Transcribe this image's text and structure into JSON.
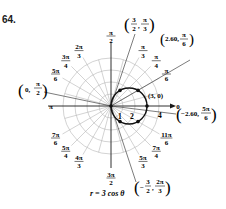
{
  "problem_number": "64.",
  "equation": "r = 3 cos θ",
  "colors": {
    "grid": "#b5b5b5",
    "axis": "#1a1a1a",
    "curve": "#111111",
    "ray": "#444444"
  },
  "geometry": {
    "cx": 111,
    "cy": 106,
    "unit_px": 12,
    "rings": [
      1,
      2,
      3,
      4
    ],
    "spokes_deg_step": 15
  },
  "radial_ticks": [
    {
      "label": "1",
      "r": 1
    },
    {
      "label": "2",
      "r": 2
    },
    {
      "label": "4",
      "r": 4
    }
  ],
  "angle_labels": [
    {
      "num": "π",
      "den": "2",
      "deg": 90
    },
    {
      "num": "π",
      "den": "3",
      "deg": 60
    },
    {
      "num": "π",
      "den": "4",
      "deg": 45
    },
    {
      "num": "π",
      "den": "6",
      "deg": 30
    },
    {
      "num": "0",
      "den": "",
      "deg": 0
    },
    {
      "num": "2π",
      "den": "3",
      "deg": 120
    },
    {
      "num": "3π",
      "den": "4",
      "deg": 135
    },
    {
      "num": "5π",
      "den": "6",
      "deg": 150
    },
    {
      "num": "π",
      "den": "",
      "deg": 180
    },
    {
      "num": "7π",
      "den": "6",
      "deg": 210
    },
    {
      "num": "5π",
      "den": "4",
      "deg": 225
    },
    {
      "num": "4π",
      "den": "3",
      "deg": 240
    },
    {
      "num": "3π",
      "den": "2",
      "deg": 270
    },
    {
      "num": "5π",
      "den": "3",
      "deg": 300
    },
    {
      "num": "7π",
      "den": "4",
      "deg": 315
    },
    {
      "num": "11π",
      "den": "6",
      "deg": 330
    }
  ],
  "points": [
    {
      "label": "(3, 0)",
      "r": 3,
      "deg": 0
    },
    {
      "label": "(2.60, π/6)",
      "r": 2.6,
      "deg": 30
    },
    {
      "label": "(3/2, π/3)",
      "r": 1.5,
      "deg": 60
    },
    {
      "label": "(0, π/2)",
      "r": 0,
      "deg": 90
    },
    {
      "label": "(−2.60, 5π/6)",
      "r": -2.6,
      "deg": 150
    },
    {
      "label": "(−3/2, 2π/3)",
      "r": -1.5,
      "deg": 120
    }
  ],
  "callouts": {
    "p3_0": "(3, 0)",
    "p260_pi6": {
      "a": "2.60,",
      "num": "π",
      "den": "6"
    },
    "p32_pi3": {
      "a_num": "3",
      "a_den": "2",
      "num": "π",
      "den": "3"
    },
    "p0_pi2": {
      "a": "0,",
      "num": "π",
      "den": "2"
    },
    "pm260_5pi6": {
      "a": "−2.60,",
      "num": "5π",
      "den": "6"
    },
    "pm32_2pi3": {
      "a_num": "3",
      "a_den": "2",
      "num": "2π",
      "den": "3"
    }
  }
}
